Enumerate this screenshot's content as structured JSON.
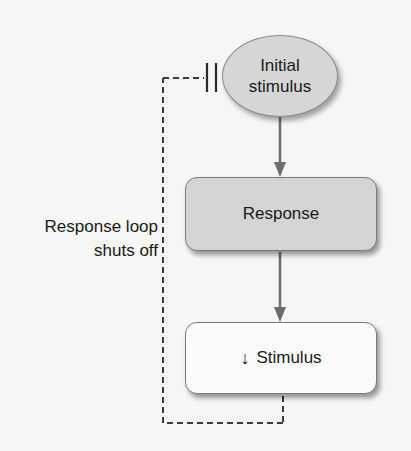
{
  "diagram": {
    "type": "negative-feedback-loop",
    "nodes": {
      "initial_stimulus": {
        "line1": "Initial",
        "line2": "stimulus",
        "shape": "ellipse",
        "fill": "#d6d6d6"
      },
      "response": {
        "label": "Response",
        "shape": "rounded-rect",
        "fill": "#d4d4d4"
      },
      "reduced_stimulus": {
        "arrow": "↓",
        "label": "Stimulus",
        "shape": "rounded-rect",
        "fill": "#fbfbfb"
      }
    },
    "edges": [
      {
        "from": "initial_stimulus",
        "to": "response",
        "style": "solid-arrow"
      },
      {
        "from": "response",
        "to": "reduced_stimulus",
        "style": "solid-arrow"
      },
      {
        "from": "reduced_stimulus",
        "to": "initial_stimulus",
        "style": "dashed-inhibition"
      }
    ],
    "loop_label": {
      "line1": "Response loop",
      "line2": "shuts off"
    },
    "colors": {
      "arrow": "#6b6b6b",
      "dashed": "#3a3a3a",
      "text": "#1a1a1a"
    }
  }
}
